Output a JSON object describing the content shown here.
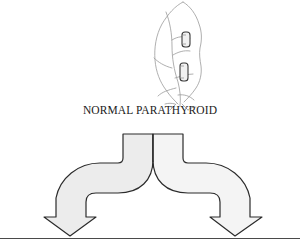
{
  "diagram": {
    "title": "NORMAL PARATHYROID",
    "arrows": [
      {
        "direction": "down-left",
        "label": ""
      },
      {
        "direction": "down-right",
        "label": ""
      }
    ],
    "colors": {
      "line": "#2b2b2b",
      "sketch_line": "#9a9a9a",
      "arrow_fill_left": "#ececec",
      "arrow_fill_right": "#f4f4f4",
      "baseline": "#4a4a4a",
      "background": "#ffffff"
    }
  }
}
